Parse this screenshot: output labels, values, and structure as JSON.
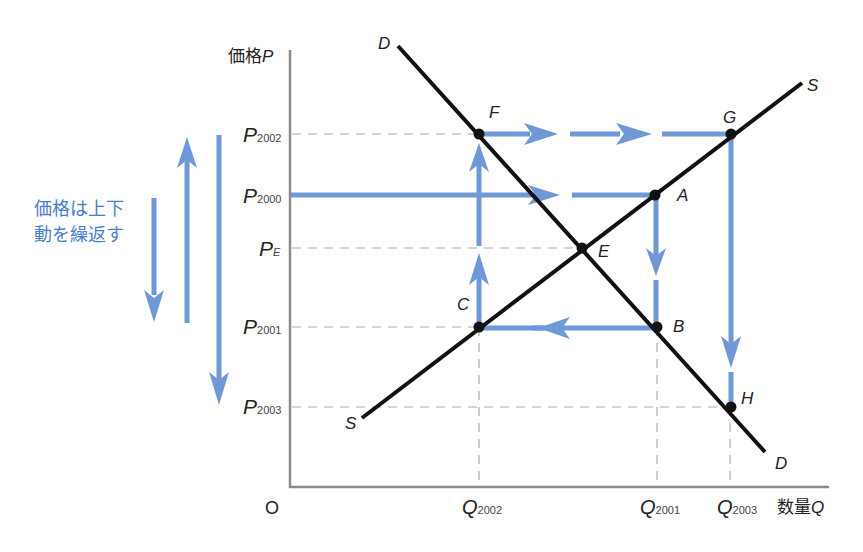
{
  "colors": {
    "arrow": "#6f98d6",
    "curve": "#111111",
    "axis": "#888888",
    "guide": "#aaaaaa",
    "note_text": "#4a7dc7"
  },
  "axes": {
    "y_label": "価格",
    "y_var": "P",
    "x_label": "数量",
    "x_var": "Q",
    "origin": "O"
  },
  "y_ticks": [
    {
      "base": "P",
      "sub": "2002"
    },
    {
      "base": "P",
      "sub": "2000"
    },
    {
      "base": "P",
      "sub": "E"
    },
    {
      "base": "P",
      "sub": "2001"
    },
    {
      "base": "P",
      "sub": "2003"
    }
  ],
  "x_ticks": [
    {
      "base": "Q",
      "sub": "2002"
    },
    {
      "base": "Q",
      "sub": "2001"
    },
    {
      "base": "Q",
      "sub": "2003"
    }
  ],
  "curves": {
    "demand": {
      "top_label": "D",
      "bottom_label": "D"
    },
    "supply": {
      "top_label": "S",
      "bottom_label": "S"
    }
  },
  "points": {
    "A": "A",
    "B": "B",
    "C": "C",
    "E": "E",
    "F": "F",
    "G": "G",
    "H": "H"
  },
  "note": {
    "line1": "価格は上下",
    "line2": "動を繰返す"
  }
}
